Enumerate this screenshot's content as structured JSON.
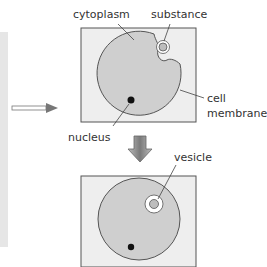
{
  "labels": {
    "cytoplasm": "cytoplasm",
    "substance": "substance",
    "cell_membrane_line1": "cell",
    "cell_membrane_line2": "membrane",
    "nucleus": "nucleus",
    "vesicle": "vesicle"
  },
  "stages": [
    {
      "name": "before",
      "description": "cell membrane invaginates around substance"
    },
    {
      "name": "after",
      "description": "substance enclosed in vesicle inside cytoplasm"
    }
  ],
  "colors": {
    "box_fill": "#eeeeee",
    "box_stroke": "#555555",
    "cell_fill": "#cfcfcf",
    "cell_stroke": "#555555",
    "nucleus": "#111111",
    "arrow": "#888888"
  }
}
